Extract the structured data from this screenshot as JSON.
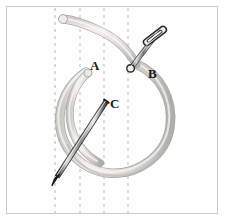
{
  "figure": {
    "background_color": "#ffffff",
    "frame": {
      "border_color": "#c9c9c9",
      "fill_color": "#fefefe"
    },
    "labels": [
      {
        "id": "label-a",
        "text": "A",
        "x": 90,
        "y": 70,
        "refers_to": "free end of the left arc of the cord"
      },
      {
        "id": "label-b",
        "text": "B",
        "x": 148,
        "y": 78,
        "refers_to": "upper needle piercing the cord"
      },
      {
        "id": "label-c",
        "text": "C",
        "x": 110,
        "y": 108,
        "refers_to": "lower needle crossing the loop"
      }
    ],
    "guide_lines": {
      "count": 4,
      "style": "dashed-vertical",
      "color": "#b8b8b8",
      "dash_pattern": "3 4",
      "x_positions": [
        55,
        80,
        104,
        128
      ],
      "y_top": 8,
      "y_bottom": 213
    },
    "cord": {
      "name": "cord",
      "description": "pale beige-gray tube forming a near-closed circular loop with a free tail at the top",
      "fill_color": "#e6e4e0",
      "outline_color": "#a9a7a3",
      "highlight_color": "#f5f4f2",
      "shadow_color": "#bcbab6"
    },
    "needles": [
      {
        "id": "needle-b",
        "label": "B",
        "description": "sewing needle with an elongated eye, angled down-left, tip at the cord",
        "body_color": "#8d8d8d",
        "outline_color": "#2e2e2e",
        "eye_color": "#ffffff",
        "eye_end": {
          "x": 162,
          "y": 27
        },
        "tip_end": {
          "x": 131,
          "y": 68
        }
      },
      {
        "id": "needle-c",
        "label": "C",
        "description": "straight needle angled down-left crossing the inside of the loop, sharp point at lower left",
        "body_color": "#8d8d8d",
        "outline_color": "#2e2e2e",
        "shaft_start": {
          "x": 106,
          "y": 101
        },
        "tip_end": {
          "x": 52,
          "y": 184
        }
      }
    ]
  }
}
